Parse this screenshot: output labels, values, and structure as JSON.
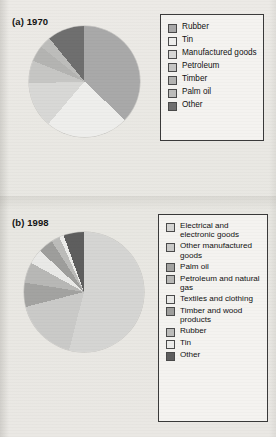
{
  "figure": {
    "background_color": "#e9e8e4",
    "panels": [
      {
        "label": "(a) 1970"
      },
      {
        "label": "(b) 1998"
      }
    ]
  },
  "chart_data": [
    {
      "type": "pie",
      "title": "(a) 1970",
      "legend_position": "right",
      "start_angle_deg": 0,
      "direction": "clockwise",
      "categories": [
        "Rubber",
        "Tin",
        "Manufactured goods",
        "Petroleum",
        "Timber",
        "Palm oil",
        "Other"
      ],
      "values": [
        33.4,
        21.7,
        11.9,
        6.0,
        4.2,
        3.0,
        9.8
      ],
      "unit": "percent of export earnings",
      "colors": [
        "#a9a9a9",
        "#eeeeec",
        "#d8d8d6",
        "#c6c6c4",
        "#b4b4b2",
        "#bdbdbb",
        "#6f6f6f"
      ],
      "slice_order_clockwise_from_top": [
        "Rubber",
        "Tin",
        "Manufactured goods",
        "Petroleum",
        "Timber",
        "Palm oil",
        "Other"
      ]
    },
    {
      "type": "pie",
      "title": "(b) 1998",
      "legend_position": "right",
      "start_angle_deg": 0,
      "direction": "clockwise",
      "categories": [
        "Electrical and electronic goods",
        "Other manufactured goods",
        "Palm oil",
        "Petroleum and natural gas",
        "Textiles and clothing",
        "Timber and wood products",
        "Rubber",
        "Tin",
        "Other"
      ],
      "values": [
        54.0,
        17.0,
        6.5,
        5.5,
        4.0,
        4.0,
        2.3,
        1.2,
        5.5
      ],
      "unit": "percent of export earnings",
      "colors": [
        "#d5d5d3",
        "#cacac8",
        "#a3a3a1",
        "#b8b8b6",
        "#e9e9e7",
        "#9e9e9c",
        "#bcbcba",
        "#ececea",
        "#5e5e5e"
      ],
      "slice_order_clockwise_from_top": [
        "Electrical and electronic goods",
        "Other manufactured goods",
        "Palm oil",
        "Petroleum and natural gas",
        "Textiles and clothing",
        "Timber and wood products",
        "Rubber",
        "Tin",
        "Other"
      ]
    }
  ],
  "legend_a": {
    "items": [
      {
        "label": "Rubber",
        "color": "#a9a9a9"
      },
      {
        "label": "Tin",
        "color": "#eeeeec"
      },
      {
        "label": "Manufactured goods",
        "color": "#d8d8d6"
      },
      {
        "label": "Petroleum",
        "color": "#c6c6c4"
      },
      {
        "label": "Timber",
        "color": "#b4b4b2"
      },
      {
        "label": "Palm oil",
        "color": "#bdbdbb"
      },
      {
        "label": "Other",
        "color": "#6f6f6f"
      }
    ]
  },
  "legend_b": {
    "items": [
      {
        "label": "Electrical and electronic goods",
        "color": "#d5d5d3"
      },
      {
        "label": "Other manufactured goods",
        "color": "#cacac8"
      },
      {
        "label": "Palm oil",
        "color": "#a3a3a1"
      },
      {
        "label": "Petroleum and natural gas",
        "color": "#b8b8b6"
      },
      {
        "label": "Textiles and clothing",
        "color": "#e9e9e7"
      },
      {
        "label": "Timber and wood products",
        "color": "#9e9e9c"
      },
      {
        "label": "Rubber",
        "color": "#bcbcba"
      },
      {
        "label": "Tin",
        "color": "#ececea"
      },
      {
        "label": "Other",
        "color": "#5e5e5e"
      }
    ]
  }
}
